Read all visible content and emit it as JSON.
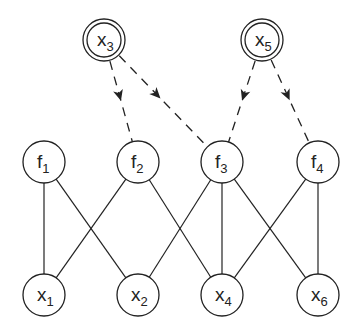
{
  "diagram": {
    "type": "factor-graph",
    "observed_nodes": [
      {
        "id": "x3",
        "base": "x",
        "sub": "3",
        "cx": 104,
        "cy": 40
      },
      {
        "id": "x5",
        "base": "x",
        "sub": "5",
        "cx": 262,
        "cy": 40
      }
    ],
    "factor_nodes": [
      {
        "id": "f1",
        "base": "f",
        "sub": "1",
        "cx": 44,
        "cy": 162
      },
      {
        "id": "f2",
        "base": "f",
        "sub": "2",
        "cx": 138,
        "cy": 162
      },
      {
        "id": "f3",
        "base": "f",
        "sub": "3",
        "cx": 222,
        "cy": 162
      },
      {
        "id": "f4",
        "base": "f",
        "sub": "4",
        "cx": 318,
        "cy": 162
      }
    ],
    "variable_nodes": [
      {
        "id": "x1",
        "base": "x",
        "sub": "1",
        "cx": 44,
        "cy": 295
      },
      {
        "id": "x2",
        "base": "x",
        "sub": "2",
        "cx": 138,
        "cy": 295
      },
      {
        "id": "x4",
        "base": "x",
        "sub": "4",
        "cx": 222,
        "cy": 295
      },
      {
        "id": "x6",
        "base": "x",
        "sub": "6",
        "cx": 318,
        "cy": 295
      }
    ],
    "dashed_arrows": [
      {
        "from": "x3",
        "to": "f2"
      },
      {
        "from": "x3",
        "to": "f3"
      },
      {
        "from": "x5",
        "to": "f3"
      },
      {
        "from": "x5",
        "to": "f4"
      }
    ],
    "edges": [
      {
        "from": "f1",
        "to": "x1"
      },
      {
        "from": "f1",
        "to": "x2"
      },
      {
        "from": "f2",
        "to": "x1"
      },
      {
        "from": "f2",
        "to": "x4"
      },
      {
        "from": "f3",
        "to": "x2"
      },
      {
        "from": "f3",
        "to": "x4"
      },
      {
        "from": "f3",
        "to": "x6"
      },
      {
        "from": "f4",
        "to": "x4"
      },
      {
        "from": "f4",
        "to": "x6"
      }
    ]
  }
}
